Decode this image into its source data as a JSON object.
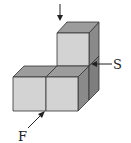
{
  "diagram": {
    "colors": {
      "front_face": "#d3d3d3",
      "top_face": "#9c9c9c",
      "side_face": "#8a8a8a",
      "edge": "#333333",
      "arrow": "#222222"
    },
    "arrows": [
      {
        "id": "top",
        "label": "",
        "direction": "down"
      },
      {
        "id": "side",
        "label": "S",
        "direction": "left"
      },
      {
        "id": "front",
        "label": "F",
        "direction": "up-right"
      }
    ],
    "labels": {
      "side": "S",
      "front": "F"
    }
  }
}
